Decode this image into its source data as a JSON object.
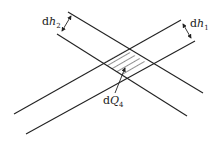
{
  "diagram": {
    "stroke_color": "#222222",
    "background": "#ffffff",
    "labels": {
      "dh2": {
        "d": "d",
        "var": "h",
        "sub": "2"
      },
      "dh1": {
        "d": "d",
        "var": "h",
        "sub": "1"
      },
      "dQ4": {
        "d": "d",
        "var": "Q",
        "sub": "4"
      }
    },
    "strips": [
      {
        "name": "descending-strip",
        "width_label": "dh2"
      },
      {
        "name": "rising-strip",
        "width_label": "dh1"
      }
    ],
    "intersection": {
      "name": "hatched-parallelogram",
      "label": "dQ4"
    }
  }
}
